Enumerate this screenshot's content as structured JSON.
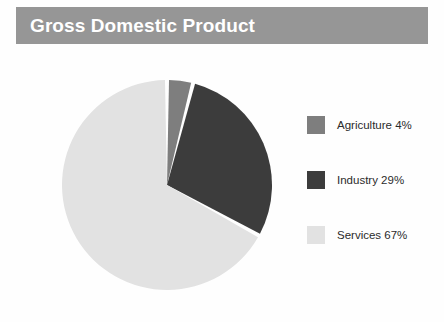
{
  "header": {
    "title": "Gross Domestic Product",
    "banner_color": "#969696",
    "title_color": "#ffffff"
  },
  "chart_data": {
    "type": "pie",
    "title": "Gross Domestic Product",
    "categories": [
      "Agriculture",
      "Industry",
      "Services"
    ],
    "values": [
      4,
      29,
      67
    ],
    "value_unit": "%",
    "labels": [
      "Agriculture 4%",
      "Industry 29%",
      "Services 67%"
    ],
    "colors": [
      "#7e7e7e",
      "#3c3c3c",
      "#e2e2e2"
    ],
    "start_angle_deg": 0,
    "direction": "clockwise",
    "separator_color": "#ffffff",
    "separator_width_deg": 2.2,
    "legend_position": "right",
    "grid": false,
    "background": "#fefefe"
  },
  "legend": {
    "items": [
      {
        "label": "Agriculture 4%",
        "color": "#7e7e7e",
        "name": "agriculture"
      },
      {
        "label": "Industry 29%",
        "color": "#3c3c3c",
        "name": "industry"
      },
      {
        "label": "Services 67%",
        "color": "#e2e2e2",
        "name": "services"
      }
    ]
  }
}
